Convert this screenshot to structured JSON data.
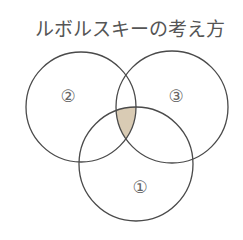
{
  "title": "ルボルスキーの考え方",
  "circles": [
    {
      "id": "1",
      "label": "①"
    },
    {
      "id": "2",
      "label": "②"
    },
    {
      "id": "3",
      "label": "③"
    }
  ],
  "highlight": {
    "region": "intersection of ①, ② and ③",
    "fill": "#d9cbb4"
  },
  "colors": {
    "stroke": "#4a4a4a",
    "text": "#555555"
  }
}
